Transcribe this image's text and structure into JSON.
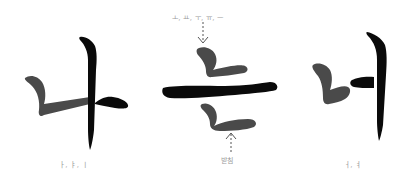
{
  "figure": {
    "colors": {
      "consonant": "#4a4a4a",
      "vowel": "#0a0a0a",
      "annotation": "#9a9a9a"
    },
    "glyphs": [
      {
        "syllable": "나",
        "consonant": "ㄴ",
        "vowel": "ㅏ",
        "caption": "ㅏ, ㅑ, ㅣ"
      },
      {
        "syllable": "는",
        "consonant": "ㄴ",
        "vowel": "ㅡ",
        "top_caption": "ㅗ, ㅛ, ㅜ, ㅠ, ㅡ",
        "bottom_caption": "받침"
      },
      {
        "syllable": "너",
        "consonant": "ㄴ",
        "vowel": "ㅓ",
        "caption": "ㅓ, ㅕ"
      }
    ]
  }
}
